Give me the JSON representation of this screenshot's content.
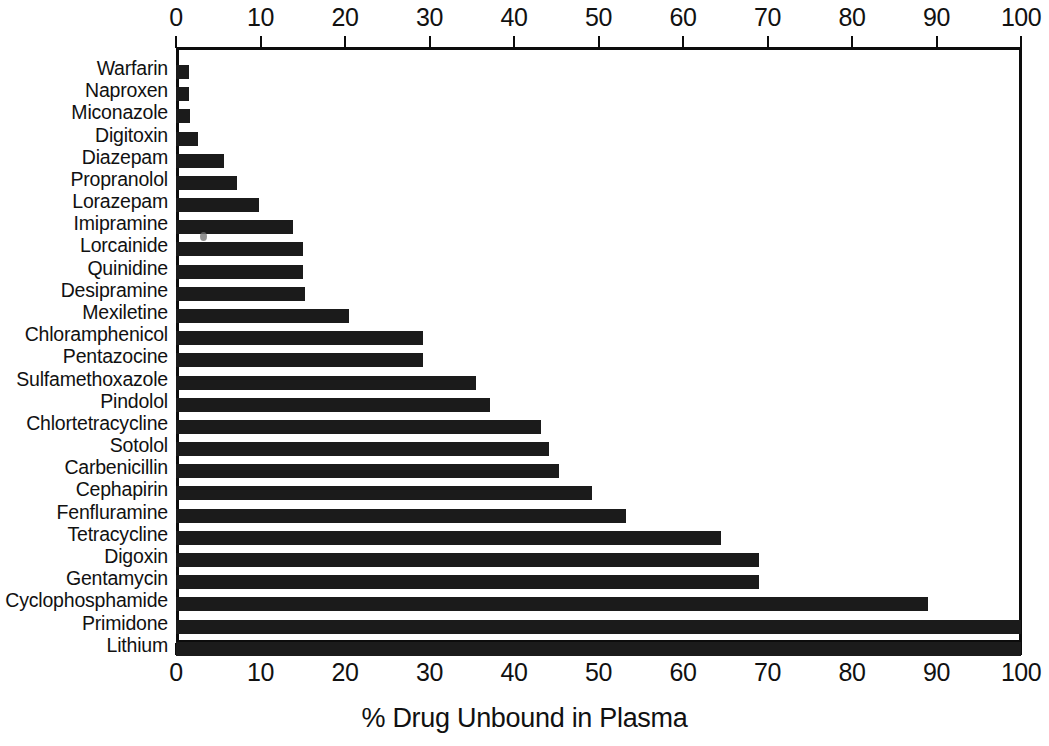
{
  "chart_data": {
    "type": "bar",
    "orientation": "horizontal",
    "title": "",
    "xlabel": "% Drug Unbound in Plasma",
    "ylabel": "",
    "xlim": [
      0,
      100
    ],
    "grid": false,
    "legend": null,
    "axis_top_ticks": [
      "0",
      "10",
      "20",
      "30",
      "40",
      "50",
      "60",
      "70",
      "80",
      "90",
      "100"
    ],
    "axis_bottom_ticks": [
      "0",
      "10",
      "20",
      "30",
      "40",
      "50",
      "60",
      "70",
      "80",
      "90",
      "100"
    ],
    "tick_values": [
      0,
      10,
      20,
      30,
      40,
      50,
      60,
      70,
      80,
      90,
      100
    ],
    "categories": [
      "Warfarin",
      "Naproxen",
      "Miconazole",
      "Digitoxin",
      "Diazepam",
      "Propranolol",
      "Lorazepam",
      "Imipramine",
      "Lorcainide",
      "Quinidine",
      "Desipramine",
      "Mexiletine",
      "Chloramphenicol",
      "Pentazocine",
      "Sulfamethoxazole",
      "Pindolol",
      "Chlortetracycline",
      "Sotolol",
      "Carbenicillin",
      "Cephapirin",
      "Fenfluramine",
      "Tetracycline",
      "Digoxin",
      "Gentamycin",
      "Cyclophosphamide",
      "Primidone",
      "Lithium"
    ],
    "values": [
      1.5,
      1.5,
      1.6,
      2.6,
      5.7,
      7.2,
      9.8,
      13.8,
      15.0,
      15.0,
      15.3,
      20.5,
      29.2,
      29.2,
      35.5,
      37.2,
      43.2,
      44.2,
      45.3,
      49.2,
      53.3,
      64.5,
      69.0,
      69.0,
      89.0,
      100.0,
      100.0
    ],
    "bar_color": "#1b1b1b",
    "background_color": "#ffffff"
  }
}
